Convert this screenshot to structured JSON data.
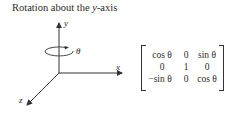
{
  "title": {
    "prefix": "Rotation about the ",
    "axis": "y",
    "suffix": "-axis"
  },
  "diagram": {
    "axis_labels": {
      "x": "x",
      "y": "y",
      "z": "z"
    },
    "rotation_label": "θ",
    "stroke_color": "#333333"
  },
  "matrix": {
    "rows": [
      [
        "cos θ",
        "0",
        "sin θ"
      ],
      [
        "0",
        "1",
        "0"
      ],
      [
        "−sin θ",
        "0",
        "cos θ"
      ]
    ]
  }
}
